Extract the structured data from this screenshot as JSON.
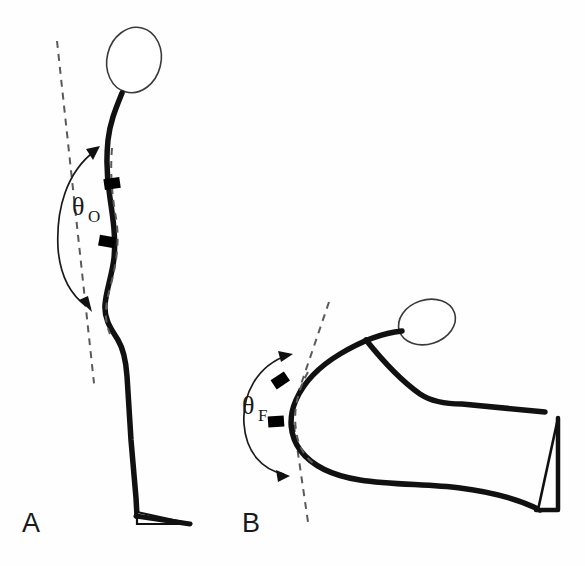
{
  "figure": {
    "background_color": "#fefefe",
    "stroke_color": "#111111",
    "dashed_color": "#5a5a5a",
    "sensor_color": "#000000",
    "head_stroke_color": "#3a3a3a"
  },
  "panels": [
    {
      "id": "panel-a",
      "letter": "A",
      "posture": "upright standing",
      "angle": {
        "symbol": "θ",
        "subscript": "O",
        "full_label": "θO",
        "name": "trunk orientation angle",
        "arc_direction": "counter-clockwise",
        "arrowheads": 2
      },
      "sensor_markers": 2,
      "reference_line": "dashed",
      "head_shape": "ellipse"
    },
    {
      "id": "panel-b",
      "letter": "B",
      "posture": "forward flexed",
      "angle": {
        "symbol": "θ",
        "subscript": "F",
        "full_label": "θF",
        "name": "trunk flexion angle",
        "arc_direction": "counter-clockwise",
        "arrowheads": 2
      },
      "sensor_markers": 2,
      "reference_line": "dashed",
      "head_shape": "ellipse"
    }
  ]
}
